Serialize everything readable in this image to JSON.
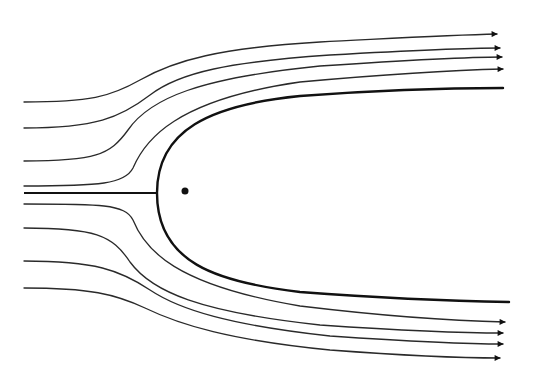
{
  "diagram": {
    "title": "",
    "colors": {
      "stroke": "#2a2a2a",
      "body": "#111111",
      "background": "#ffffff"
    },
    "source_point": {
      "x": 185,
      "y": 191,
      "r": 3.5
    },
    "stagnation_point": {
      "x": 157,
      "y": 193
    },
    "dividing_streamline": {
      "d": "M157,193 C157,130 210,105 300,96 C380,90 450,88 503,88 M157,193 C157,262 215,282 300,292 C380,298 450,301 509,302"
    },
    "centerline": {
      "d": "M24,193 L157,193"
    },
    "streamlines": [
      {
        "id": "upper-1",
        "d": "M24,102 C90,102 110,97 140,80 C175,60 220,48 320,42 C400,38 450,35 497,34",
        "arrow": true
      },
      {
        "id": "upper-2",
        "d": "M24,128 C95,128 120,118 150,95 C180,72 230,62 330,55 C420,50 460,48 500,48",
        "arrow": true
      },
      {
        "id": "upper-3",
        "d": "M24,161 C95,161 110,155 128,130 C150,98 200,78 320,66 C410,60 460,57 502,57",
        "arrow": true
      },
      {
        "id": "upper-4",
        "d": "M24,186 C100,186 125,184 133,168 C145,140 175,100 300,82 C400,73 460,70 503,69",
        "arrow": true
      },
      {
        "id": "lower-1",
        "d": "M24,204 C100,204 125,204 133,220 C145,250 175,285 300,306 C400,318 460,321 505,322",
        "arrow": true
      },
      {
        "id": "lower-2",
        "d": "M24,228 C95,228 112,235 130,262 C152,292 200,312 320,325 C410,331 460,333 503,333",
        "arrow": true
      },
      {
        "id": "lower-3",
        "d": "M24,261 C95,261 120,270 150,290 C180,310 230,325 330,336 C420,342 460,344 503,344",
        "arrow": true
      },
      {
        "id": "lower-4",
        "d": "M24,288 C90,288 115,294 145,308 C180,325 230,340 330,350 C410,356 455,358 500,358",
        "arrow": true
      }
    ]
  }
}
